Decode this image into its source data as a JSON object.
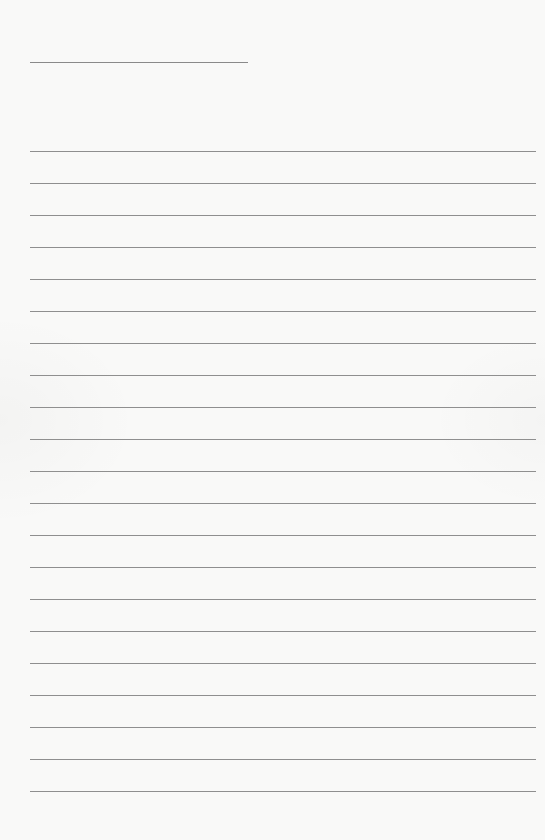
{
  "page": {
    "type": "lined-paper",
    "background_color": "#f9f9f8",
    "line_color": "#8f8f8f"
  },
  "title_line": {
    "x": 30,
    "y": 62,
    "width": 218
  },
  "ruled_lines": {
    "count": 21,
    "x": 30,
    "width": 506,
    "first_y": 151,
    "spacing": 32
  }
}
